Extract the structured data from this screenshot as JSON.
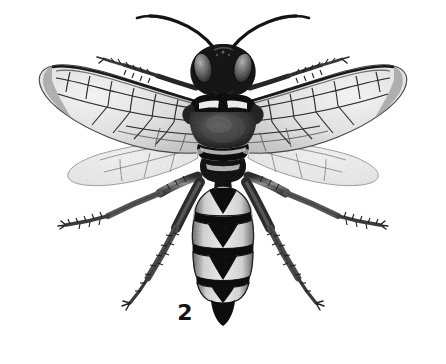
{
  "figure": {
    "label": "2",
    "caption_number": "2",
    "background_color": "#ffffff",
    "ink_color": "#1a1a1a"
  },
  "specimen": {
    "common_name": "wasp",
    "view": "dorsal",
    "parts": [
      {
        "name": "antenna-left",
        "label": "antenna"
      },
      {
        "name": "antenna-right",
        "label": "antenna"
      },
      {
        "name": "head",
        "label": "head"
      },
      {
        "name": "compound-eye-left",
        "label": "compound eye"
      },
      {
        "name": "compound-eye-right",
        "label": "compound eye"
      },
      {
        "name": "pronotum",
        "label": "pronotum"
      },
      {
        "name": "mesoscutum",
        "label": "mesoscutum"
      },
      {
        "name": "scutellum",
        "label": "scutellum"
      },
      {
        "name": "propodeum",
        "label": "propodeum"
      },
      {
        "name": "forewing-left",
        "label": "forewing"
      },
      {
        "name": "forewing-right",
        "label": "forewing"
      },
      {
        "name": "hindwing-left",
        "label": "hindwing"
      },
      {
        "name": "hindwing-right",
        "label": "hindwing"
      },
      {
        "name": "abdomen",
        "label": "abdomen"
      },
      {
        "name": "foreleg-left",
        "label": "foreleg"
      },
      {
        "name": "foreleg-right",
        "label": "foreleg"
      },
      {
        "name": "midleg-left",
        "label": "midleg"
      },
      {
        "name": "midleg-right",
        "label": "midleg"
      },
      {
        "name": "hindleg-left",
        "label": "hindleg"
      },
      {
        "name": "hindleg-right",
        "label": "hindleg"
      }
    ],
    "abdomen_segments": 5,
    "markings": "pale bands with dark median triangular spots on each tergite"
  },
  "palette": {
    "paper": "#ffffff",
    "dark_ink": "#151515",
    "mid_ink": "#5a5a5a",
    "light_ink": "#9a9a9a",
    "wing_membrane": "#e8e8e8",
    "wing_shade": "#cfcfcf",
    "pale_band": "#f2f2f2"
  }
}
